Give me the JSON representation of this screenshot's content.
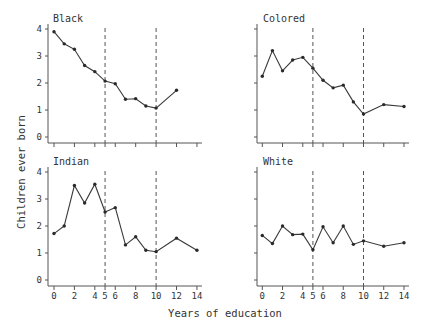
{
  "chart_data": {
    "type": "line",
    "layout": "2x2 small multiples",
    "xlabel": "Years of education",
    "ylabel": "Children ever born",
    "x_ticks": [
      0,
      2,
      4,
      5,
      6,
      8,
      10,
      12,
      14
    ],
    "y_ticks": [
      0,
      1,
      2,
      3,
      4
    ],
    "xlim": [
      0,
      14
    ],
    "ylim": [
      0,
      4
    ],
    "reference_lines_x": [
      5,
      10
    ],
    "reference_line_style": "dashed",
    "grid": false,
    "x_tick_labels_shown_on": [
      "Indian",
      "White"
    ],
    "y_tick_labels_shown_on": [
      "Black",
      "Indian"
    ],
    "panels": [
      {
        "name": "Black",
        "x": [
          0,
          1,
          2,
          3,
          4,
          5,
          6,
          7,
          8,
          9,
          10,
          12
        ],
        "values": [
          3.9,
          3.45,
          3.25,
          2.65,
          2.42,
          2.07,
          1.97,
          1.4,
          1.42,
          1.15,
          1.07,
          1.73
        ]
      },
      {
        "name": "Colored",
        "x": [
          0,
          1,
          2,
          3,
          4,
          5,
          6,
          7,
          8,
          9,
          10,
          12,
          14
        ],
        "values": [
          2.25,
          3.2,
          2.45,
          2.85,
          2.95,
          2.55,
          2.1,
          1.82,
          1.92,
          1.3,
          0.85,
          1.2,
          1.13
        ]
      },
      {
        "name": "Indian",
        "x": [
          0,
          1,
          2,
          3,
          4,
          5,
          6,
          7,
          8,
          9,
          10,
          12,
          14
        ],
        "values": [
          1.72,
          2.0,
          3.5,
          2.85,
          3.55,
          2.52,
          2.68,
          1.3,
          1.6,
          1.1,
          1.05,
          1.55,
          1.1
        ]
      },
      {
        "name": "White",
        "x": [
          0,
          1,
          2,
          3,
          4,
          5,
          6,
          7,
          8,
          9,
          10,
          12,
          14
        ],
        "values": [
          1.65,
          1.35,
          2.0,
          1.68,
          1.7,
          1.12,
          1.97,
          1.38,
          2.0,
          1.32,
          1.45,
          1.25,
          1.38
        ]
      }
    ]
  },
  "labels": {
    "xlabel": "Years of education",
    "ylabel": "Children ever born",
    "panel_titles": [
      "Black",
      "Colored",
      "Indian",
      "White"
    ]
  },
  "colors": {
    "line": "#3a3a3a",
    "marker": "#2a2a2a",
    "axis": "#555555",
    "text": "#333333",
    "background": "#ffffff"
  }
}
